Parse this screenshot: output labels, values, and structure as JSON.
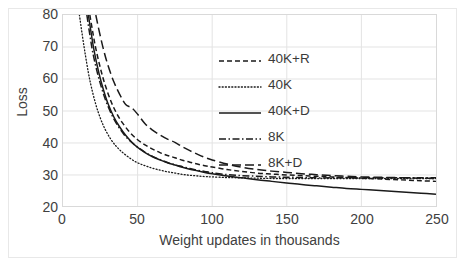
{
  "chart_data": {
    "type": "line",
    "title": "",
    "xlabel": "Weight updates in thousands",
    "ylabel": "Loss",
    "xlim": [
      0,
      250
    ],
    "ylim": [
      20,
      80
    ],
    "xticks": [
      0,
      50,
      100,
      150,
      200,
      250
    ],
    "yticks": [
      20,
      30,
      40,
      50,
      60,
      70,
      80
    ],
    "grid": "both",
    "legend_position": "upper-center-right",
    "colors": {
      "line": "#1a1a1a",
      "grid": "#e3e3e3",
      "axis": "#d9d9d9",
      "text": "#404040",
      "frame": "#e8e8e8",
      "background": "#ffffff"
    },
    "series": [
      {
        "name": "40K+R",
        "dash": "dashed",
        "x": [
          18,
          20,
          22,
          25,
          28,
          32,
          36,
          40,
          45,
          50,
          55,
          60,
          65,
          70,
          75,
          80,
          85,
          90,
          95,
          100,
          110,
          120,
          130,
          140,
          150,
          160,
          170,
          180,
          190,
          200,
          210,
          220,
          230,
          240,
          250
        ],
        "y": [
          80,
          74.5,
          69.5,
          63.5,
          58.5,
          53.2,
          49.2,
          46.2,
          43.2,
          41.0,
          39.4,
          38.1,
          37.0,
          36.1,
          35.4,
          34.6,
          34.0,
          33.4,
          32.9,
          32.5,
          31.7,
          31.1,
          30.6,
          30.3,
          30.0,
          29.8,
          29.6,
          29.4,
          29.2,
          29.0,
          28.8,
          28.6,
          28.4,
          28.2,
          28.0
        ]
      },
      {
        "name": "40K",
        "dash": "dotted",
        "x": [
          11,
          13,
          15,
          17,
          19,
          22,
          25,
          28,
          32,
          36,
          40,
          45,
          50,
          55,
          60,
          65,
          70,
          75,
          80,
          85,
          90,
          95,
          100,
          110,
          120,
          130,
          140,
          150,
          160,
          170,
          180,
          190,
          200,
          210,
          220,
          230,
          240,
          250
        ],
        "y": [
          80,
          73.5,
          67.5,
          62.0,
          57.5,
          52.0,
          47.8,
          44.5,
          41.2,
          38.8,
          37.0,
          35.2,
          33.8,
          32.9,
          32.1,
          31.5,
          31.0,
          30.6,
          30.2,
          29.9,
          29.7,
          29.5,
          29.4,
          29.2,
          29.1,
          29.0,
          28.9,
          28.9,
          28.9,
          28.9,
          28.9,
          28.9,
          28.9,
          28.9,
          28.9,
          28.9,
          28.9,
          28.9
        ]
      },
      {
        "name": "40K+D",
        "dash": "solid",
        "x": [
          17,
          19,
          21,
          24,
          27,
          30,
          34,
          38,
          42,
          46,
          50,
          55,
          60,
          65,
          70,
          75,
          80,
          85,
          90,
          95,
          100,
          110,
          120,
          130,
          140,
          150,
          160,
          170,
          180,
          190,
          200,
          210,
          220,
          230,
          240,
          250
        ],
        "y": [
          80,
          74.0,
          68.5,
          62.0,
          56.8,
          52.5,
          48.2,
          45.0,
          42.4,
          40.3,
          38.6,
          37.0,
          35.7,
          34.7,
          33.8,
          33.1,
          32.4,
          31.8,
          31.3,
          30.8,
          30.4,
          29.7,
          29.1,
          28.5,
          28.0,
          27.5,
          27.0,
          26.6,
          26.2,
          25.8,
          25.5,
          25.2,
          24.9,
          24.6,
          24.3,
          24.0
        ]
      },
      {
        "name": "8K",
        "dash": "dashdot",
        "x": [
          16,
          18,
          20,
          23,
          26,
          29,
          33,
          37,
          41,
          45,
          50,
          55,
          60,
          65,
          70,
          75,
          80,
          85,
          90,
          95,
          100,
          110,
          120,
          130,
          140,
          150,
          160,
          170,
          180,
          190,
          200,
          210,
          220,
          230,
          240,
          250
        ],
        "y": [
          80,
          73.8,
          68.2,
          62.0,
          57.0,
          52.8,
          48.5,
          45.2,
          42.6,
          40.6,
          38.7,
          37.1,
          35.8,
          34.8,
          33.9,
          33.2,
          32.6,
          32.0,
          31.5,
          31.1,
          30.7,
          30.1,
          29.8,
          29.6,
          29.4,
          29.3,
          29.2,
          29.1,
          29.1,
          29.1,
          29.1,
          29.1,
          29.1,
          29.1,
          29.1,
          29.1
        ]
      },
      {
        "name": "8K+D",
        "dash": "longdash",
        "x": [
          22,
          24,
          27,
          30,
          34,
          38,
          42,
          46,
          50,
          55,
          60,
          65,
          70,
          75,
          80,
          85,
          90,
          95,
          100,
          110,
          120,
          130,
          140,
          150,
          160,
          170,
          180,
          190,
          200,
          210,
          220,
          230,
          240,
          250
        ],
        "y": [
          80,
          75.5,
          69.5,
          64.5,
          59.2,
          55.2,
          52.0,
          51.0,
          49.0,
          46.0,
          44.0,
          42.5,
          41.2,
          40.2,
          38.8,
          37.6,
          36.5,
          35.5,
          34.7,
          33.4,
          32.4,
          31.7,
          31.2,
          30.8,
          30.4,
          30.1,
          29.8,
          29.6,
          29.4,
          29.3,
          29.2,
          29.1,
          29.0,
          28.9
        ]
      }
    ],
    "legend": [
      {
        "label": "40K+R",
        "dash": "dashed"
      },
      {
        "label": "40K",
        "dash": "dotted"
      },
      {
        "label": "40K+D",
        "dash": "solid"
      },
      {
        "label": "8K",
        "dash": "dashdot"
      },
      {
        "label": "8K+D",
        "dash": "longdash"
      }
    ]
  }
}
